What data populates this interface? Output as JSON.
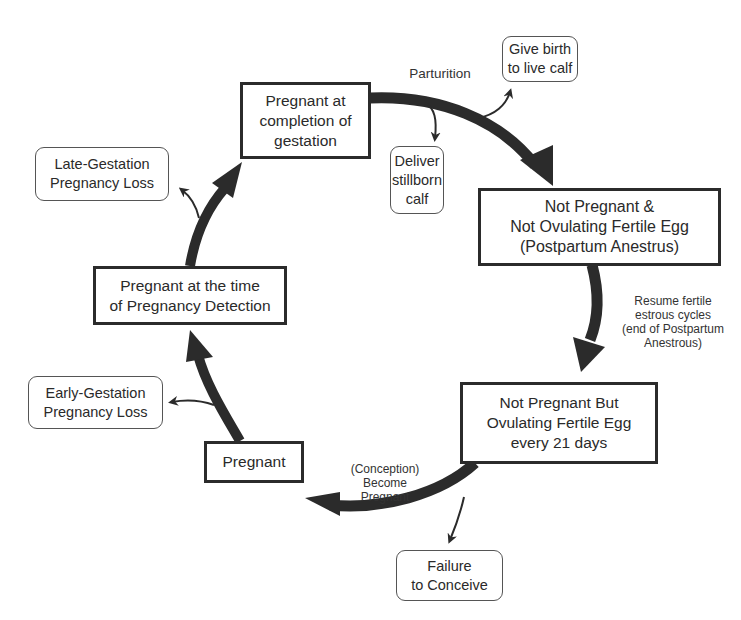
{
  "diagram": {
    "type": "cycle",
    "states": {
      "completion": "Pregnant at\ncompletion of\ngestation",
      "anestrus": "Not Pregnant &\nNot Ovulating Fertile Egg\n(Postpartum Anestrus)",
      "ovulating": "Not Pregnant But\nOvulating Fertile Egg\nevery 21 days",
      "pregnant": "Pregnant",
      "detection": "Pregnant at the time\nof Pregnancy Detection"
    },
    "outcomes": {
      "live_calf": "Give birth\nto live calf",
      "stillborn": "Deliver\nstillborn\ncalf",
      "late_loss": "Late-Gestation\nPregnancy Loss",
      "early_loss": "Early-Gestation\nPregnancy Loss",
      "failure": "Failure\nto Conceive"
    },
    "transitions": {
      "parturition": "Parturition",
      "resume": "Resume fertile\nestrous cycles\n(end of Postpartum\nAnestrous)",
      "conception": "(Conception)\nBecome\nPregnant"
    },
    "colors": {
      "arrow": "#2b2b2b",
      "box_border": "#2b2b2b",
      "outcome_border": "#555555",
      "text": "#2a2a2a"
    }
  }
}
